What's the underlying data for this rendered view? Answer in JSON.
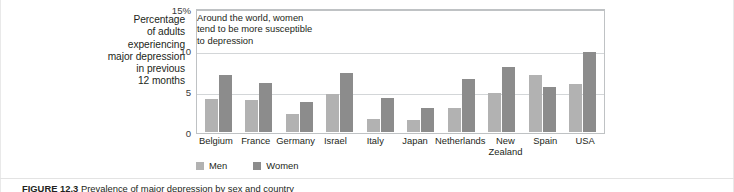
{
  "figure": {
    "axis_title": "Percentage of adults experiencing major depression in previous 12 months",
    "axis_title_lines": [
      "Percentage",
      "of adults",
      "experiencing",
      "major depression",
      "in previous",
      "12 months"
    ],
    "annotation": "Around the world, women tend to be more susceptible to depression",
    "annotation_lines": [
      "Around the world, women",
      "tend to be more susceptible",
      "to depression"
    ],
    "caption_number": "FIGURE 12.3",
    "caption_text": "Prevalence of major depression by sex and country",
    "colors": {
      "men": "#b2b2b2",
      "women": "#8c8c8c",
      "gridline": "#d3d6d8",
      "axis": "#bfc2c4",
      "text": "#231f20",
      "background": "#ffffff"
    }
  },
  "yaxis": {
    "ticks": [
      "15%",
      "10",
      "5",
      "0"
    ],
    "tick_top": "15%",
    "tick_10": "10",
    "tick_5": "5",
    "tick_0": "0"
  },
  "legend": {
    "items": [
      {
        "label": "Men",
        "color": "#b2b2b2"
      },
      {
        "label": "Women",
        "color": "#8c8c8c"
      }
    ],
    "men_label": "Men",
    "women_label": "Women"
  },
  "chart_data": {
    "type": "bar",
    "title": "",
    "subtitle": "",
    "xlabel": "",
    "ylabel": "Percentage of adults experiencing major depression in previous 12 months",
    "ylim": [
      0,
      15
    ],
    "yticks": [
      0,
      5,
      10,
      15
    ],
    "ytick_labels": [
      "0",
      "5",
      "10",
      "15%"
    ],
    "grid": true,
    "grid_axis": "y",
    "legend_position": "bottom-left",
    "annotation": "Around the world, women tend to be more susceptible to depression",
    "categories": [
      "Belgium",
      "France",
      "Germany",
      "Israel",
      "Italy",
      "Japan",
      "Netherlands",
      "New Zealand",
      "Spain",
      "USA"
    ],
    "series": [
      {
        "name": "Men",
        "color": "#b2b2b2",
        "values": [
          4.0,
          3.9,
          2.2,
          4.6,
          1.6,
          1.5,
          2.9,
          4.7,
          7.0,
          5.9
        ]
      },
      {
        "name": "Women",
        "color": "#8c8c8c",
        "values": [
          6.9,
          6.0,
          3.7,
          7.2,
          4.2,
          2.9,
          6.5,
          7.9,
          5.5,
          9.8
        ]
      }
    ]
  }
}
